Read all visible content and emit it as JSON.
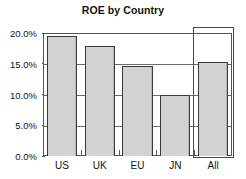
{
  "chart_data": {
    "type": "bar",
    "title": "ROE by Country",
    "xlabel": "",
    "ylabel": "",
    "categories": [
      "US",
      "UK",
      "EU",
      "JN",
      "All"
    ],
    "values": [
      0.195,
      0.179,
      0.147,
      0.1,
      0.153
    ],
    "value_labels": [
      "19.5%",
      "17.9%",
      "14.7%",
      "10.0%",
      "15.3%"
    ],
    "ylim": [
      0.0,
      0.2
    ],
    "ytick_values": [
      0.0,
      0.05,
      0.1,
      0.15,
      0.2
    ],
    "ytick_labels": [
      "0.0%",
      "5.0%",
      "10.0%",
      "15.0%",
      "20.0%"
    ],
    "grid": true,
    "grid_axis": "y",
    "legend": false,
    "legend_position": "none",
    "bar_fill_color": "#d2d2d2",
    "bar_border_color": "#3a3a3a",
    "gridline_color": "#6d6d6d",
    "annotations": [
      {
        "name": "all-category-highlight",
        "kind": "rectangle-outline",
        "target_category": "All",
        "color": "#4a4a4a"
      }
    ]
  }
}
